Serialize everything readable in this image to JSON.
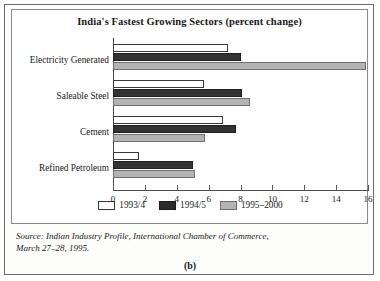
{
  "figure": {
    "caption": "(b)",
    "source_line1": "Source: Indian Industry Profile, International Chamber of Commerce,",
    "source_line2": "March 27–28, 1995."
  },
  "legend": {
    "items": [
      {
        "label": "1993/4",
        "swatch": "white-swatch"
      },
      {
        "label": "1994/5",
        "swatch": "black-swatch"
      },
      {
        "label": "1995–2000",
        "swatch": "gray-swatch"
      }
    ]
  },
  "chart_data": {
    "type": "bar",
    "orientation": "horizontal",
    "title": "India's Fastest Growing Sectors (percent change)",
    "xlabel": "",
    "ylabel": "",
    "xlim": [
      0,
      16
    ],
    "xticks": [
      0,
      2,
      4,
      6,
      8,
      10,
      12,
      14,
      16
    ],
    "xticklabels": [
      "0",
      "2",
      "4",
      "6",
      "8",
      "10",
      "12",
      "14",
      "16"
    ],
    "grid": false,
    "legend_position": "bottom",
    "categories": [
      "Electricity Generated",
      "Saleable Steel",
      "Cement",
      "Refined Petroleum"
    ],
    "series": [
      {
        "name": "1993/4",
        "color": "#ffffff",
        "values": [
          7.2,
          5.7,
          6.9,
          1.6
        ]
      },
      {
        "name": "1994/5",
        "color": "#333333",
        "values": [
          8.0,
          8.1,
          7.7,
          5.0
        ]
      },
      {
        "name": "1995–2000",
        "color": "#b3b3b3",
        "values": [
          15.9,
          8.6,
          5.8,
          5.15
        ]
      }
    ]
  }
}
